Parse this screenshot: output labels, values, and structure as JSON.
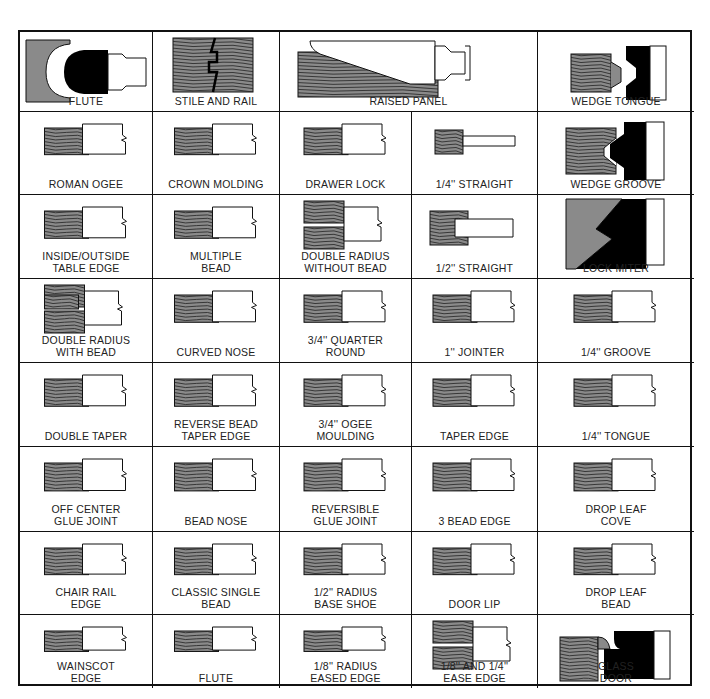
{
  "colors": {
    "wood": "#8a8a8a",
    "grain": "#222222",
    "line": "#111111",
    "bit": "#000000",
    "paper": "#ffffff"
  },
  "cells": [
    {
      "label": "FLUTE",
      "profile": "bit-flute",
      "col": 0,
      "row": 0,
      "span": 1
    },
    {
      "label": "STILE AND RAIL",
      "profile": "stile-rail",
      "col": 1,
      "row": 0,
      "span": 1
    },
    {
      "label": "RAISED PANEL",
      "profile": "raised-panel",
      "col": 2,
      "row": 0,
      "span": 2
    },
    {
      "label": "WEDGE TONGUE",
      "profile": "wedge-tongue",
      "col": 4,
      "row": 0,
      "span": 1
    },
    {
      "label": "ROMAN OGEE",
      "profile": "ogee",
      "col": 0,
      "row": 1,
      "span": 1
    },
    {
      "label": "CROWN MOLDING",
      "profile": "crown",
      "col": 1,
      "row": 1,
      "span": 1
    },
    {
      "label": "DRAWER LOCK",
      "profile": "drawer-lock",
      "col": 2,
      "row": 1,
      "span": 1
    },
    {
      "label": "1/4'' STRAIGHT",
      "profile": "straight-small",
      "col": 3,
      "row": 1,
      "span": 1
    },
    {
      "label": "WEDGE GROOVE",
      "profile": "wedge-groove",
      "col": 4,
      "row": 1,
      "span": 1
    },
    {
      "label": "INSIDE/OUTSIDE\nTABLE EDGE",
      "profile": "table-edge",
      "col": 0,
      "row": 2,
      "span": 1
    },
    {
      "label": "MULTIPLE\nBEAD",
      "profile": "multi-bead",
      "col": 1,
      "row": 2,
      "span": 1
    },
    {
      "label": "DOUBLE RADIUS\nWITHOUT BEAD",
      "profile": "double-radius",
      "col": 2,
      "row": 2,
      "span": 1
    },
    {
      "label": "1/2'' STRAIGHT",
      "profile": "straight-med",
      "col": 3,
      "row": 2,
      "span": 1
    },
    {
      "label": "LOCK MITER",
      "profile": "lock-miter",
      "col": 4,
      "row": 2,
      "span": 1
    },
    {
      "label": "DOUBLE RADIUS\nWITH BEAD",
      "profile": "double-radius-bead",
      "col": 0,
      "row": 3,
      "span": 1
    },
    {
      "label": "CURVED NOSE",
      "profile": "curved-nose",
      "col": 1,
      "row": 3,
      "span": 1
    },
    {
      "label": "3/4'' QUARTER\nROUND",
      "profile": "quarter-round",
      "col": 2,
      "row": 3,
      "span": 1
    },
    {
      "label": "1'' JOINTER",
      "profile": "jointer",
      "col": 3,
      "row": 3,
      "span": 1
    },
    {
      "label": "1/4'' GROOVE",
      "profile": "groove",
      "col": 4,
      "row": 3,
      "span": 1
    },
    {
      "label": "DOUBLE TAPER",
      "profile": "double-taper",
      "col": 0,
      "row": 4,
      "span": 1
    },
    {
      "label": "REVERSE BEAD\nTAPER EDGE",
      "profile": "reverse-bead",
      "col": 1,
      "row": 4,
      "span": 1
    },
    {
      "label": "3/4'' OGEE\nMOULDING",
      "profile": "ogee-moulding",
      "col": 2,
      "row": 4,
      "span": 1
    },
    {
      "label": "TAPER EDGE",
      "profile": "taper-edge",
      "col": 3,
      "row": 4,
      "span": 1
    },
    {
      "label": "1/4'' TONGUE",
      "profile": "tongue",
      "col": 4,
      "row": 4,
      "span": 1
    },
    {
      "label": "OFF CENTER\nGLUE JOINT",
      "profile": "glue-joint",
      "col": 0,
      "row": 5,
      "span": 1
    },
    {
      "label": "BEAD NOSE",
      "profile": "bead-nose",
      "col": 1,
      "row": 5,
      "span": 1
    },
    {
      "label": "REVERSIBLE\nGLUE JOINT",
      "profile": "rev-glue",
      "col": 2,
      "row": 5,
      "span": 1
    },
    {
      "label": "3 BEAD EDGE",
      "profile": "three-bead",
      "col": 3,
      "row": 5,
      "span": 1
    },
    {
      "label": "DROP LEAF\nCOVE",
      "profile": "cove",
      "col": 4,
      "row": 5,
      "span": 1
    },
    {
      "label": "CHAIR RAIL\nEDGE",
      "profile": "chair-rail",
      "col": 0,
      "row": 6,
      "span": 1
    },
    {
      "label": "CLASSIC SINGLE\nBEAD",
      "profile": "single-bead",
      "col": 1,
      "row": 6,
      "span": 1
    },
    {
      "label": "1/2'' RADIUS\nBASE SHOE",
      "profile": "base-shoe",
      "col": 2,
      "row": 6,
      "span": 1
    },
    {
      "label": "DOOR LIP",
      "profile": "door-lip",
      "col": 3,
      "row": 6,
      "span": 1
    },
    {
      "label": "DROP LEAF\nBEAD",
      "profile": "drop-bead",
      "col": 4,
      "row": 6,
      "span": 1
    },
    {
      "label": "WAINSCOT\nEDGE",
      "profile": "wainscot",
      "col": 0,
      "row": 7,
      "span": 1
    },
    {
      "label": "FLUTE",
      "profile": "flute-edge",
      "col": 1,
      "row": 7,
      "span": 1
    },
    {
      "label": "1/8'' RADIUS\nEASED EDGE",
      "profile": "eased",
      "col": 2,
      "row": 7,
      "span": 1
    },
    {
      "label": "1/8'' AND 1/4''\nEASE EDGE",
      "profile": "ease-two",
      "col": 3,
      "row": 7,
      "span": 1
    },
    {
      "label": "GLASS\nDOOR",
      "profile": "glass-door",
      "col": 4,
      "row": 7,
      "span": 1
    }
  ]
}
